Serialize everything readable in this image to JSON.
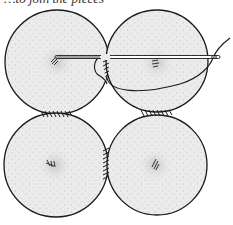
{
  "caption": "…to join the pieces",
  "illustration": {
    "subject": "four fabric yo-yo circles whipstitched together",
    "fill_color": "#ebebeb",
    "stroke_color": "#1a1a1a",
    "circles": [
      {
        "id": "top-left",
        "cx": 57,
        "cy": 62,
        "r": 52
      },
      {
        "id": "top-right",
        "cx": 157,
        "cy": 61,
        "r": 51
      },
      {
        "id": "bottom-left",
        "cx": 56,
        "cy": 165,
        "r": 52
      },
      {
        "id": "bottom-right",
        "cx": 157,
        "cy": 165,
        "r": 50
      }
    ],
    "needle": {
      "x1": 55,
      "y1": 57,
      "x2": 220,
      "y2": 58
    },
    "icons": [
      "needle-icon",
      "thread-icon",
      "whipstitch-icon"
    ]
  }
}
